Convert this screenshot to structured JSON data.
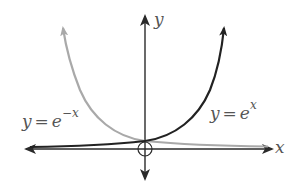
{
  "figure": {
    "title": "",
    "axes": {
      "x_label": "x",
      "y_label": "y",
      "origin_marker": "circle-with-cross"
    },
    "curves": [
      {
        "name": "exp-negative-x",
        "label_lhs": "y",
        "label_rel": "=",
        "label_base": "e",
        "label_exponent": "−x",
        "color": "#a9a9a9"
      },
      {
        "name": "exp-x",
        "label_lhs": "y",
        "label_rel": "=",
        "label_base": "e",
        "label_exponent": "x",
        "color": "#222222"
      }
    ],
    "colors": {
      "axis": "#2a2a2a",
      "label": "#555555",
      "background": "#ffffff"
    }
  }
}
